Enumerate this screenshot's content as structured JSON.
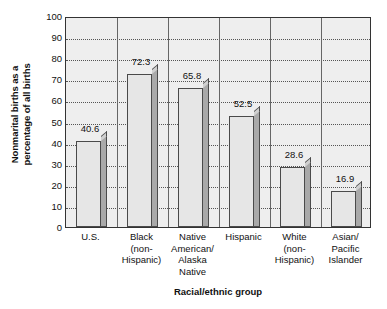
{
  "chart_data": {
    "type": "bar",
    "title": "",
    "xlabel": "Racial/ethnic group",
    "ylabel": "Nonmarital births as a percentage of all births",
    "ylabel_lines": [
      "Nonmarital births as a",
      "percentage of all births"
    ],
    "categories": [
      "U.S.",
      "Black (non-Hispanic)",
      "Native American/ Alaska Native",
      "Hispanic",
      "White (non-Hispanic)",
      "Asian/ Pacific Islander"
    ],
    "category_lines": [
      [
        "U.S."
      ],
      [
        "Black",
        "(non-",
        "Hispanic)"
      ],
      [
        "Native",
        "American/",
        "Alaska",
        "Native"
      ],
      [
        "Hispanic"
      ],
      [
        "White",
        "(non-",
        "Hispanic)"
      ],
      [
        "Asian/",
        "Pacific",
        "Islander"
      ]
    ],
    "values": [
      40.6,
      72.3,
      65.8,
      52.5,
      28.6,
      16.9
    ],
    "value_labels": [
      "40.6",
      "72.3",
      "65.8",
      "52.5",
      "28.6",
      "16.9"
    ],
    "ylim": [
      0,
      100
    ],
    "ytick_values": [
      100,
      90,
      80,
      70,
      60,
      50,
      40,
      30,
      20,
      10,
      0
    ],
    "ytick_labels": [
      "100",
      "90",
      "80",
      "70",
      "60",
      "50",
      "40",
      "30",
      "20",
      "10",
      "0"
    ],
    "grid": true,
    "grid_orientation": "horizontal",
    "grid_style": "dotted",
    "legend": null,
    "style": "3d-bar",
    "colors": {
      "bar_face": "#e6e6e6",
      "bar_side": "#a9a9a9",
      "bar_outline": "#4a4a4a",
      "plot_background": "#eeeeee",
      "axis": "#333333",
      "gridline": "#555555",
      "text": "#111111"
    }
  }
}
